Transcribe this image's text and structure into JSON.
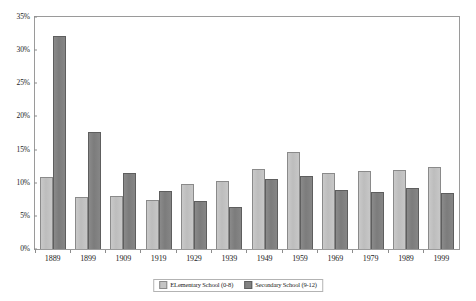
{
  "chart_data": {
    "type": "bar",
    "title": "",
    "subtitle": "",
    "xlabel": "",
    "ylabel": "",
    "ylim": [
      0,
      35
    ],
    "ytick_labels": [
      "0%",
      "5%",
      "10%",
      "15%",
      "20%",
      "25%",
      "30%",
      "35%"
    ],
    "ytick_values": [
      0,
      5,
      10,
      15,
      20,
      25,
      30,
      35
    ],
    "grid": false,
    "legend_position": "bottom-center",
    "categories": [
      "1889",
      "1899",
      "1909",
      "1919",
      "1929",
      "1939",
      "1949",
      "1959",
      "1969",
      "1979",
      "1989",
      "1999"
    ],
    "series": [
      {
        "name": "ELementary School (0-8)",
        "color": "#c4c4c4",
        "values": [
          10.9,
          7.8,
          8.0,
          7.4,
          9.8,
          10.3,
          12.1,
          14.7,
          11.4,
          11.7,
          11.9,
          12.4
        ]
      },
      {
        "name": "Secondary School (9-12)",
        "color": "#828282",
        "values": [
          32.1,
          17.6,
          11.4,
          8.8,
          7.2,
          6.4,
          10.6,
          11.0,
          8.9,
          8.6,
          9.2,
          8.4
        ]
      }
    ]
  },
  "legend": {
    "items": [
      {
        "label": "ELementary School (0-8)"
      },
      {
        "label": "Secondary School (9-12)"
      }
    ]
  }
}
